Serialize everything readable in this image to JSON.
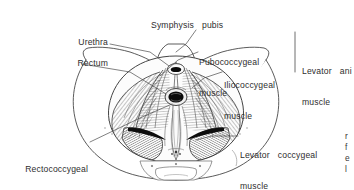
{
  "figure": {
    "type": "anatomical-line-illustration",
    "background_color": "#ffffff",
    "ink_color": "#2b2b2b",
    "text_color": "#2e2e2e"
  },
  "labels": {
    "symphysis_pubis": "Symphysis  pubis",
    "urethra": "Urethra",
    "rectum": "Rectum",
    "pubococcygeal_line1": "Pubococcygeal",
    "pubococcygeal_line2": "muscle",
    "iliococcygeal_line1": "Iliococcygeal",
    "iliococcygeal_line2": "muscle",
    "levator_ani_line1": "Levator  ani",
    "levator_ani_line2": "muscle",
    "levator_coccygeal_line1": "Levator  coccygeal",
    "levator_coccygeal_line2": "muscle",
    "rectococcygeal_line1": "Rectococcygeal",
    "rectococcygeal_line2": "muscle"
  },
  "edge_text_fragment": "r\nf\ne\nl",
  "structures": [
    "pelvic brim outline",
    "pubic symphysis",
    "urethral opening",
    "rectal opening",
    "pubococcygeus muscle sheet",
    "iliococcygeus muscle sheet",
    "levator coccygeal muscle",
    "rectococcygeal muscle",
    "coccyx",
    "ischial tuberosity"
  ]
}
